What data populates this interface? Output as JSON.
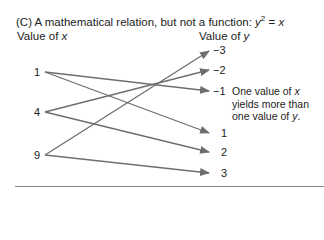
{
  "title": {
    "prefix": "(C) A mathematical relation, but not a function: ",
    "equation_lhs": "y",
    "equation_exp": "2",
    "equation_eq": " = ",
    "equation_rhs": "x"
  },
  "columns": {
    "x_head_prefix": "Value of ",
    "x_head_var": "x",
    "y_head_prefix": "Value of ",
    "y_head_var": "y"
  },
  "x_values": [
    "1",
    "4",
    "9"
  ],
  "y_values": [
    "−3",
    "−2",
    "−1",
    "1",
    "2",
    "3"
  ],
  "mappings": [
    {
      "from": "1",
      "to": "−1"
    },
    {
      "from": "1",
      "to": "1"
    },
    {
      "from": "4",
      "to": "−2"
    },
    {
      "from": "4",
      "to": "2"
    },
    {
      "from": "9",
      "to": "−3"
    },
    {
      "from": "9",
      "to": "3"
    }
  ],
  "annotation": {
    "line1_prefix": "One value of ",
    "line1_var": "x",
    "line2": "yields more than",
    "line3_prefix": "one value of ",
    "line3_var": "y",
    "line3_suffix": "."
  },
  "colors": {
    "arrow": "#6e6e6e",
    "text": "#222222",
    "rule": "#888888"
  }
}
